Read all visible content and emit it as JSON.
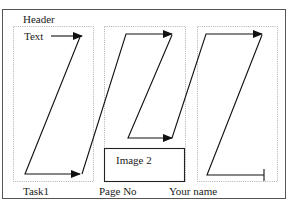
{
  "diagram": {
    "header_label": "Header",
    "text_label": "Text",
    "image_label": "Image 2",
    "footer": {
      "left": "Task1",
      "center": "Page No",
      "right": "Your name"
    },
    "colors": {
      "frame": "#555555",
      "guides": "#999999",
      "lines": "#111111"
    }
  }
}
